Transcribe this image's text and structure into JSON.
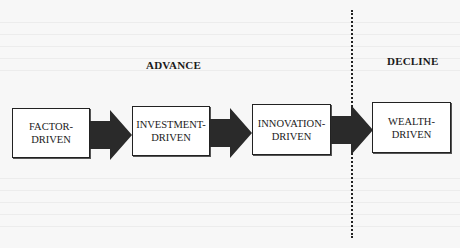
{
  "diagram": {
    "phases": {
      "advance": "ADVANCE",
      "decline": "DECLINE"
    },
    "stages": [
      {
        "line1": "FACTOR-",
        "line2": "DRIVEN"
      },
      {
        "line1": "INVESTMENT-",
        "line2": "DRIVEN"
      },
      {
        "line1": "INNOVATION-",
        "line2": "DRIVEN"
      },
      {
        "line1": "WEALTH-",
        "line2": "DRIVEN"
      }
    ],
    "colors": {
      "box_border": "#222222",
      "arrow_fill": "#2a2a2a",
      "background": "#f7f7f7"
    }
  }
}
